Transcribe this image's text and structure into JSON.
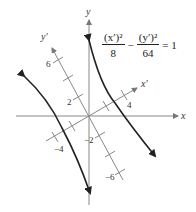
{
  "diagram": {
    "type": "rotated-hyperbola",
    "equation": {
      "term1_numerator": "(x′)²",
      "term1_denominator": "8",
      "operator": "−",
      "term2_numerator": "(y′)²",
      "term2_denominator": "64",
      "equals": "= 1"
    },
    "axes": {
      "x_label": "x",
      "y_label": "y",
      "x_prime_label": "x′",
      "y_prime_label": "y′"
    },
    "tick_labels": {
      "y_prime_6": "6",
      "y_prime_2": "2",
      "y_prime_neg2": "−2",
      "y_prime_neg6": "−6",
      "x_prime_4": "4",
      "x_prime_neg4": "−4"
    },
    "colors": {
      "axis": "#888888",
      "curve": "#222222",
      "text": "#333333"
    }
  }
}
